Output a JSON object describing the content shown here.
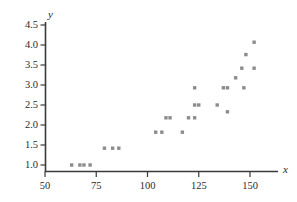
{
  "chart_data": {
    "type": "scatter",
    "title": "",
    "xlabel": "x",
    "ylabel": "y",
    "xlim": [
      50,
      157
    ],
    "ylim": [
      0.85,
      4.62
    ],
    "grid": false,
    "legend": null,
    "marker": {
      "shape": "square",
      "color": "#8c8c8c",
      "size": 3.4
    },
    "axis_color": "#3a3a3a",
    "xticks": [
      50,
      75,
      100,
      125,
      150
    ],
    "xticklabels": [
      "50",
      "75",
      "100",
      "125",
      "150"
    ],
    "yticks": [
      1.0,
      1.5,
      2.0,
      2.5,
      3.0,
      3.5,
      4.0,
      4.5
    ],
    "yticklabels": [
      "1.0",
      "1.5",
      "2.0",
      "2.5",
      "3.0",
      "3.5",
      "4.0",
      "4.5"
    ],
    "points": [
      {
        "x": 63,
        "y": 1.0
      },
      {
        "x": 67,
        "y": 1.0
      },
      {
        "x": 69,
        "y": 1.0
      },
      {
        "x": 72,
        "y": 1.0
      },
      {
        "x": 79,
        "y": 1.42
      },
      {
        "x": 83,
        "y": 1.42
      },
      {
        "x": 86,
        "y": 1.42
      },
      {
        "x": 104,
        "y": 1.82
      },
      {
        "x": 107,
        "y": 1.82
      },
      {
        "x": 109,
        "y": 2.18
      },
      {
        "x": 111,
        "y": 2.18
      },
      {
        "x": 117,
        "y": 1.82
      },
      {
        "x": 120,
        "y": 2.18
      },
      {
        "x": 123,
        "y": 2.93
      },
      {
        "x": 123,
        "y": 2.18
      },
      {
        "x": 123,
        "y": 2.5
      },
      {
        "x": 125,
        "y": 2.5
      },
      {
        "x": 134,
        "y": 2.5
      },
      {
        "x": 137,
        "y": 2.93
      },
      {
        "x": 139,
        "y": 2.93
      },
      {
        "x": 139,
        "y": 2.33
      },
      {
        "x": 143,
        "y": 3.18
      },
      {
        "x": 146,
        "y": 3.42
      },
      {
        "x": 147,
        "y": 2.93
      },
      {
        "x": 148,
        "y": 3.76
      },
      {
        "x": 152,
        "y": 4.07
      },
      {
        "x": 152,
        "y": 3.42
      }
    ]
  }
}
